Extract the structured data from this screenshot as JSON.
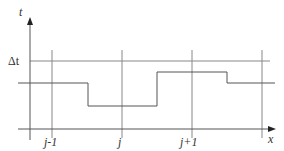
{
  "diagram": {
    "axes": {
      "y_label": "t",
      "x_label": "x",
      "delta_label": "Δt"
    },
    "grid_labels": [
      "j-1",
      "j",
      "j+1"
    ],
    "colors": {
      "line": "#555555",
      "text": "#333333"
    }
  }
}
